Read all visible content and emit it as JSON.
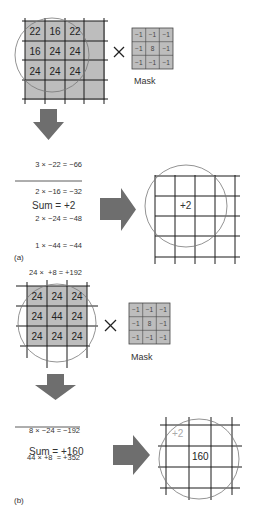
{
  "panel_a": {
    "label": "(a)",
    "input_grid": [
      [
        "22",
        "16",
        "22"
      ],
      [
        "16",
        "24",
        "24"
      ],
      [
        "24",
        "24",
        "24"
      ]
    ],
    "operator": "×",
    "mask": [
      [
        "−1",
        "−1",
        "−1"
      ],
      [
        "−1",
        "8",
        "−1"
      ],
      [
        "−1",
        "−1",
        "−1"
      ]
    ],
    "mask_label": "Mask",
    "equations": [
      "3 × −22 = −66",
      "2 × −16 = −32",
      "2 × −24 = −48",
      "1 × −44 = −44",
      "24 ×  +8 = +192"
    ],
    "sum": "Sum = +2",
    "result_value": "+2"
  },
  "panel_b": {
    "label": "(b)",
    "input_grid": [
      [
        "24",
        "24",
        "24"
      ],
      [
        "24",
        "44",
        "24"
      ],
      [
        "24",
        "24",
        "24"
      ]
    ],
    "operator": "×",
    "mask": [
      [
        "−1",
        "−1",
        "−1"
      ],
      [
        "−1",
        "8",
        "−1"
      ],
      [
        "−1",
        "−1",
        "−1"
      ]
    ],
    "mask_label": "Mask",
    "equations": [
      "8 × −24 = −192",
      "44 × +8  = +352"
    ],
    "sum": "Sum = +160",
    "prior_value": "+2",
    "result_value": "160"
  },
  "colors": {
    "cell_fill": "#bdbdbd",
    "arrow_fill": "#6e6e6e",
    "grid_line": "#1a1a1a",
    "circle": "#777777",
    "faded_text": "#aaaaaa"
  }
}
